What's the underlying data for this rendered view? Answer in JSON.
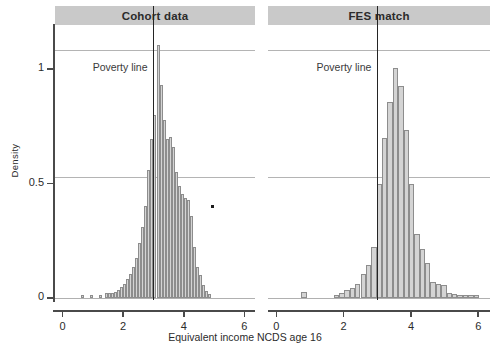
{
  "figure": {
    "xlabel": "Equivalent income NCDS age 16",
    "ylabel": "Density",
    "poverty_label_left": "Poverty line",
    "poverty_label_right": "Poverty line"
  },
  "panels": [
    {
      "title": "Cohort data"
    },
    {
      "title": "FES match"
    }
  ],
  "axes": {
    "y_ticks": [
      "0",
      "0.5",
      "1"
    ],
    "y_values": [
      0,
      0.5,
      1
    ],
    "x_ticks": [
      "0",
      "2",
      "4",
      "6"
    ],
    "x_values": [
      0,
      2,
      4,
      6
    ],
    "xlim": [
      -0.25,
      6.35
    ],
    "ylim": [
      0,
      1.18
    ]
  },
  "chart_data": {
    "type": "bar",
    "title": "",
    "xlabel": "Equivalent income NCDS age 16",
    "ylabel": "Density",
    "xlim": [
      -0.25,
      6.35
    ],
    "ylim": [
      0,
      1.18
    ],
    "grid": true,
    "legend": null,
    "annotations": [
      {
        "text": "Poverty line",
        "panel": "Cohort data",
        "x": 3.0,
        "type": "vline"
      },
      {
        "text": "Poverty line",
        "panel": "FES match",
        "x": 3.0,
        "type": "vline"
      }
    ],
    "panels": [
      {
        "name": "Cohort data",
        "type": "histogram",
        "bin_width": 0.1,
        "bin_centers": [
          0.65,
          0.95,
          1.25,
          1.45,
          1.55,
          1.65,
          1.75,
          1.85,
          1.95,
          2.05,
          2.15,
          2.25,
          2.35,
          2.45,
          2.55,
          2.65,
          2.75,
          2.85,
          2.95,
          3.05,
          3.15,
          3.25,
          3.35,
          3.45,
          3.55,
          3.65,
          3.75,
          3.85,
          3.95,
          4.05,
          4.15,
          4.25,
          4.35,
          4.45,
          4.55,
          4.65,
          4.75,
          4.85
        ],
        "values": [
          0.012,
          0.012,
          0.012,
          0.02,
          0.022,
          0.024,
          0.028,
          0.035,
          0.05,
          0.06,
          0.082,
          0.105,
          0.135,
          0.175,
          0.24,
          0.31,
          0.4,
          0.56,
          0.695,
          0.8,
          1.105,
          0.93,
          0.78,
          0.695,
          0.705,
          0.66,
          0.55,
          0.49,
          0.455,
          0.435,
          0.43,
          0.36,
          0.225,
          0.135,
          0.1,
          0.055,
          0.03,
          0.018
        ]
      },
      {
        "name": "FES match",
        "type": "histogram",
        "bin_width": 0.16,
        "bin_centers": [
          0.82,
          1.78,
          1.95,
          2.1,
          2.26,
          2.42,
          2.58,
          2.74,
          2.9,
          3.06,
          3.22,
          3.38,
          3.54,
          3.7,
          3.86,
          4.02,
          4.18,
          4.34,
          4.5,
          4.66,
          4.82,
          4.98,
          5.14,
          5.3,
          5.46,
          5.62,
          5.78,
          5.94
        ],
        "values": [
          0.025,
          0.012,
          0.022,
          0.035,
          0.045,
          0.062,
          0.105,
          0.145,
          0.225,
          0.5,
          0.7,
          0.855,
          1.005,
          0.925,
          0.735,
          0.5,
          0.28,
          0.215,
          0.155,
          0.07,
          0.06,
          0.055,
          0.022,
          0.018,
          0.015,
          0.014,
          0.013,
          0.012
        ]
      }
    ]
  }
}
